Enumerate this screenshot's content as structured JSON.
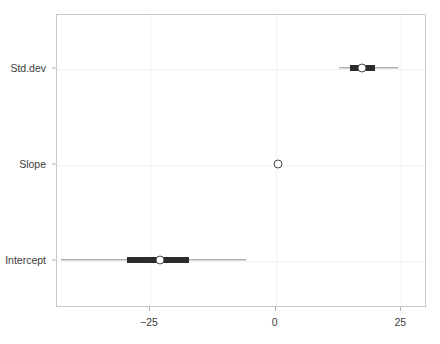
{
  "chart_data": {
    "type": "interval",
    "title": "",
    "xlabel": "",
    "ylabel": "",
    "xlim": [
      -43.5,
      30.1
    ],
    "ylim": [
      0,
      3
    ],
    "grid": true,
    "legend": null,
    "orientation": "horizontal",
    "xticks": [
      -25,
      0,
      25
    ],
    "xtick_labels": [
      "−25",
      "0",
      "25"
    ],
    "categories": [
      "Intercept",
      "Slope",
      "Std.dev"
    ],
    "series": [
      {
        "name": "posterior-interval",
        "parameters": [
          {
            "label": "Std.dev",
            "estimate": 17.3,
            "inner_low": 15.0,
            "inner_high": 19.9,
            "outer_low": 12.8,
            "outer_high": 24.6
          },
          {
            "label": "Slope",
            "estimate": 0.6,
            "inner_low": 0.6,
            "inner_high": 0.6,
            "outer_low": 0.6,
            "outer_high": 0.6
          },
          {
            "label": "Intercept",
            "estimate": -22.9,
            "inner_low": -29.3,
            "inner_high": -17.1,
            "outer_low": -42.5,
            "outer_high": -5.8
          }
        ]
      }
    ],
    "colors": {
      "point_fill": "#ffffff",
      "point_stroke": "#4a4a4a",
      "inner_band": "#2b2b2b",
      "outer_band": "#8c8c8c",
      "panel_border": "#c9c9c9",
      "gridline": "#f2f2f2",
      "background": "#ffffff",
      "tick_text": "#3c3c3c"
    }
  }
}
